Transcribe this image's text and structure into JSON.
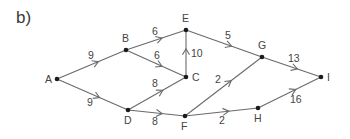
{
  "part_label": "b)",
  "colors": {
    "edge": "#6a6a6a",
    "node": "#1a1a1a",
    "text": "#444444"
  },
  "nodes": [
    {
      "id": "A",
      "x": 57,
      "y": 79,
      "lx": -12,
      "ly": 4
    },
    {
      "id": "B",
      "x": 126,
      "y": 50,
      "lx": -4,
      "ly": -8
    },
    {
      "id": "E",
      "x": 186,
      "y": 30,
      "lx": -4,
      "ly": -8
    },
    {
      "id": "C",
      "x": 186,
      "y": 77,
      "lx": 6,
      "ly": 4
    },
    {
      "id": "D",
      "x": 128,
      "y": 110,
      "lx": -4,
      "ly": 14
    },
    {
      "id": "F",
      "x": 185,
      "y": 116,
      "lx": -4,
      "ly": 14
    },
    {
      "id": "G",
      "x": 262,
      "y": 57,
      "lx": -4,
      "ly": -8
    },
    {
      "id": "H",
      "x": 258,
      "y": 108,
      "lx": -4,
      "ly": 14
    },
    {
      "id": "I",
      "x": 321,
      "y": 77,
      "lx": 6,
      "ly": 4
    }
  ],
  "edges": [
    {
      "from": "A",
      "to": "B",
      "weight": "9",
      "wx": 88,
      "wy": 59
    },
    {
      "from": "A",
      "to": "D",
      "weight": "9",
      "wx": 87,
      "wy": 106
    },
    {
      "from": "B",
      "to": "E",
      "weight": "6",
      "wx": 152,
      "wy": 35
    },
    {
      "from": "B",
      "to": "C",
      "weight": "6",
      "wx": 154,
      "wy": 59
    },
    {
      "from": "C",
      "to": "E",
      "weight": "10",
      "wx": 191,
      "wy": 57
    },
    {
      "from": "D",
      "to": "C",
      "weight": "8",
      "wx": 152,
      "wy": 87
    },
    {
      "from": "D",
      "to": "F",
      "weight": "8",
      "wx": 152,
      "wy": 125
    },
    {
      "from": "E",
      "to": "G",
      "weight": "5",
      "wx": 225,
      "wy": 39
    },
    {
      "from": "F",
      "to": "G",
      "weight": "2",
      "wx": 215,
      "wy": 83
    },
    {
      "from": "F",
      "to": "H",
      "weight": "2",
      "wx": 219,
      "wy": 124
    },
    {
      "from": "G",
      "to": "I",
      "weight": "13",
      "wx": 288,
      "wy": 62
    },
    {
      "from": "H",
      "to": "I",
      "weight": "16",
      "wx": 290,
      "wy": 103
    }
  ]
}
